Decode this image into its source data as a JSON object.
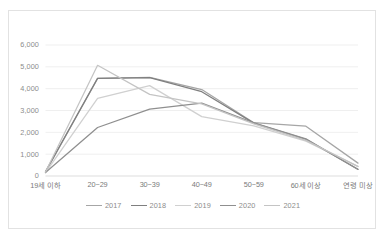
{
  "chart_data": {
    "type": "line",
    "title": "",
    "xlabel": "",
    "ylabel": "",
    "categories": [
      "19세 이하",
      "20~29",
      "30~39",
      "40~49",
      "50~59",
      "60세 이상",
      "연령 미상"
    ],
    "ylim": [
      0,
      6000
    ],
    "ytick_labels": [
      "0",
      "1,000",
      "2,000",
      "3,000",
      "4,000",
      "5,000",
      "6,000"
    ],
    "ytick_values": [
      0,
      1000,
      2000,
      3000,
      4000,
      5000,
      6000
    ],
    "grid": true,
    "legend_position": "bottom",
    "series": [
      {
        "name": "2017",
        "color": "#a6a6a6",
        "values": [
          170,
          4470,
          4520,
          3960,
          2440,
          2280,
          590
        ]
      },
      {
        "name": "2018",
        "color": "#7f7f7f",
        "values": [
          200,
          4470,
          4510,
          3860,
          2420,
          1680,
          310
        ]
      },
      {
        "name": "2019",
        "color": "#d0d0d0",
        "values": [
          150,
          3560,
          4140,
          2720,
          2300,
          1600,
          430
        ]
      },
      {
        "name": "2020",
        "color": "#8f8f8f",
        "values": [
          160,
          2220,
          3060,
          3340,
          2430,
          1700,
          300
        ]
      },
      {
        "name": "2021",
        "color": "#c4c4c4",
        "values": [
          180,
          5070,
          3740,
          3300,
          2390,
          1630,
          440
        ]
      }
    ]
  },
  "axis": {
    "y_tick_0": "0",
    "y_tick_1": "1,000",
    "y_tick_2": "2,000",
    "y_tick_3": "3,000",
    "y_tick_4": "4,000",
    "y_tick_5": "5,000",
    "y_tick_6": "6,000",
    "x_tick_0": "19세 이하",
    "x_tick_1": "20~29",
    "x_tick_2": "30~39",
    "x_tick_3": "40~49",
    "x_tick_4": "50~59",
    "x_tick_5": "60세 이상",
    "x_tick_6": "연령 미상"
  },
  "legend": {
    "items": [
      {
        "label": "2017"
      },
      {
        "label": "2018"
      },
      {
        "label": "2019"
      },
      {
        "label": "2020"
      },
      {
        "label": "2021"
      }
    ]
  }
}
